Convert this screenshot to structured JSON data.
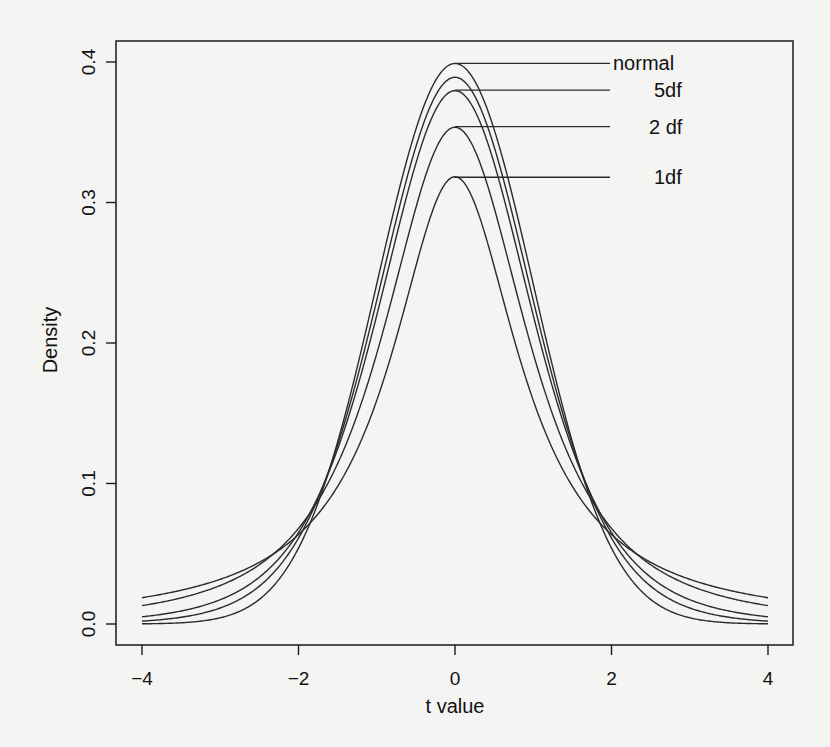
{
  "chart_data": {
    "type": "line",
    "title": "",
    "xlabel": "t value",
    "ylabel": "Density",
    "xlim": [
      -4,
      4
    ],
    "ylim": [
      0,
      0.4
    ],
    "grid": false,
    "legend": "inline labels with leader lines at curve peaks",
    "x_ticks": [
      -4,
      -2,
      0,
      2,
      4
    ],
    "x_tick_labels": [
      "−4",
      "−2",
      "0",
      "2",
      "4"
    ],
    "y_ticks": [
      0.0,
      0.1,
      0.2,
      0.3,
      0.4
    ],
    "y_tick_labels": [
      "0.0",
      "0.1",
      "0.2",
      "0.3",
      "0.4"
    ],
    "x": [
      -4,
      -3.5,
      -3,
      -2.5,
      -2,
      -1.5,
      -1,
      -0.5,
      0,
      0.5,
      1,
      1.5,
      2,
      2.5,
      3,
      3.5,
      4
    ],
    "series": [
      {
        "name": "normal",
        "label": "normal",
        "df": null,
        "peak": 0.399,
        "values": [
          0.0001,
          0.0009,
          0.0044,
          0.0175,
          0.054,
          0.1295,
          0.242,
          0.3521,
          0.3989,
          0.3521,
          0.242,
          0.1295,
          0.054,
          0.0175,
          0.0044,
          0.0009,
          0.0001
        ]
      },
      {
        "name": "t (10 df)",
        "label": "",
        "df": 10,
        "peak": 0.389,
        "values": [
          0.0028,
          0.0056,
          0.0114,
          0.0238,
          0.0611,
          0.1274,
          0.2304,
          0.3397,
          0.3891,
          0.3397,
          0.2304,
          0.1274,
          0.0611,
          0.0238,
          0.0114,
          0.0056,
          0.0028
        ]
      },
      {
        "name": "t (5 df)",
        "label": "5df",
        "df": 5,
        "peak": 0.38,
        "values": [
          0.0051,
          0.0087,
          0.0173,
          0.0332,
          0.0651,
          0.1245,
          0.2197,
          0.3279,
          0.3796,
          0.3279,
          0.2197,
          0.1245,
          0.0651,
          0.0332,
          0.0173,
          0.0087,
          0.0051
        ]
      },
      {
        "name": "t (2 df)",
        "label": "2 df",
        "df": 2,
        "peak": 0.354,
        "values": [
          0.0131,
          0.0185,
          0.0275,
          0.0422,
          0.068,
          0.1141,
          0.1925,
          0.2962,
          0.3536,
          0.2962,
          0.1925,
          0.1141,
          0.068,
          0.0422,
          0.0275,
          0.0185,
          0.0131
        ]
      },
      {
        "name": "t (1 df)",
        "label": "1df",
        "df": 1,
        "peak": 0.318,
        "values": [
          0.0187,
          0.0241,
          0.0318,
          0.0439,
          0.0637,
          0.0979,
          0.1592,
          0.2546,
          0.3183,
          0.2546,
          0.1592,
          0.0979,
          0.0637,
          0.0439,
          0.0318,
          0.0241,
          0.0187
        ]
      }
    ]
  },
  "style": {
    "line_color": "#2b2b2b",
    "axis_color": "#1a1a1a",
    "background": "#f4f4f2"
  }
}
